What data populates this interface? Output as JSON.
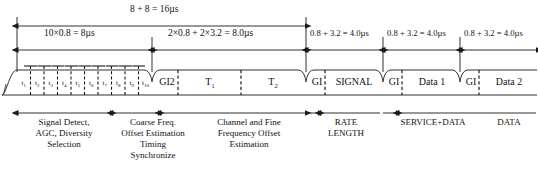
{
  "figure": {
    "type": "timing-diagram",
    "standard_context": "IEEE 802.11a OFDM PPDU preamble / training structure",
    "width": 538,
    "height": 176,
    "colors": {
      "line": "#1a1a1a",
      "text": "#111111",
      "background": "#ffffff"
    }
  },
  "dimensions": {
    "total": "8 + 8 = 16µs",
    "short_training": "10×0.8 = 8µs",
    "long_training": "2×0.8 + 2×3.2 = 8.0µs",
    "signal": "0.8 + 3.2 = 4.0µs",
    "data1": "0.8 + 3.2 = 4.0µs",
    "data2": "0.8 + 3.2 = 4.0µs"
  },
  "short_symbols": [
    {
      "label": "t",
      "index": "1"
    },
    {
      "label": "t",
      "index": "2"
    },
    {
      "label": "t",
      "index": "3"
    },
    {
      "label": "t",
      "index": "4"
    },
    {
      "label": "t",
      "index": "5"
    },
    {
      "label": "t",
      "index": "6"
    },
    {
      "label": "t",
      "index": "7"
    },
    {
      "label": "t",
      "index": "8"
    },
    {
      "label": "t",
      "index": "9"
    },
    {
      "label": "t",
      "index": "10"
    }
  ],
  "symbols": {
    "gi2": "GI2",
    "t1": "T",
    "t1_sub": "1",
    "t2": "T",
    "t2_sub": "2",
    "gi_signal": "GI",
    "signal": "SIGNAL",
    "gi_data1": "GI",
    "data1": "Data 1",
    "gi_data2": "GI",
    "data2": "Data 2"
  },
  "annotations": [
    {
      "id": "signal-detect",
      "text": "Signal Detect,\nAGC, Diversity\nSelection"
    },
    {
      "id": "coarse-freq",
      "text": "Coarse Freq.\nOffset Estimation\nTiming\nSynchronize"
    },
    {
      "id": "channel-fine",
      "text": "Channel and Fine\nFrequency Offset\nEstimation"
    },
    {
      "id": "rate-length",
      "text": "RATE\nLENGTH"
    },
    {
      "id": "service-data",
      "text": "SERVICE+DATA"
    },
    {
      "id": "data",
      "text": "DATA"
    }
  ]
}
